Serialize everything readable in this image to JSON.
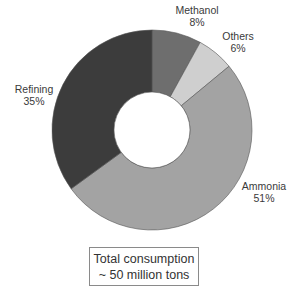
{
  "chart_data": {
    "type": "pie",
    "variant": "donut",
    "title": "",
    "categories": [
      "Methanol",
      "Others",
      "Ammonia",
      "Refining"
    ],
    "values": [
      8,
      6,
      51,
      35
    ],
    "unit": "%",
    "colors": [
      "#6e6e6e",
      "#cfcfcf",
      "#a3a3a3",
      "#3c3c3c"
    ],
    "start_angle_deg": 0,
    "direction": "clockwise",
    "annotation": [
      "Total consumption",
      "~ 50 million tons"
    ],
    "legend": "none (direct labels)"
  },
  "labels": {
    "methanol": {
      "name": "Methanol",
      "pct": "8%"
    },
    "others": {
      "name": "Others",
      "pct": "6%"
    },
    "ammonia": {
      "name": "Ammonia",
      "pct": "51%"
    },
    "refining": {
      "name": "Refining",
      "pct": "35%"
    }
  },
  "total": {
    "line1": "Total consumption",
    "line2": "~ 50 million tons"
  }
}
